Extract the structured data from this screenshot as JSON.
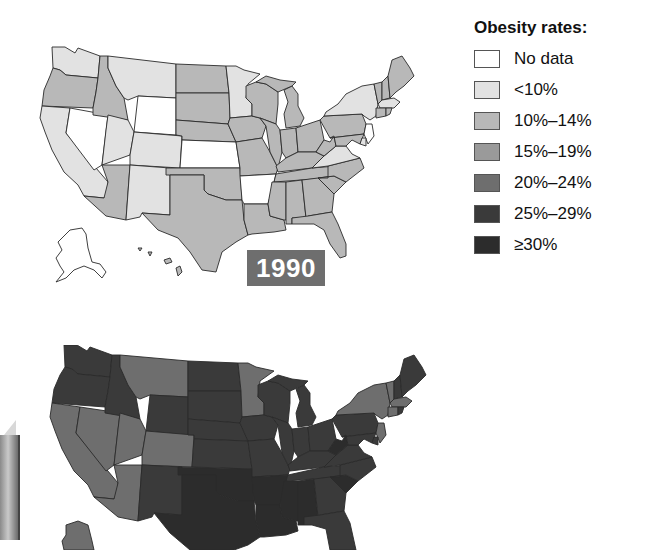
{
  "legend": {
    "title": "Obesity rates:",
    "items": [
      {
        "label": "No data",
        "color": "#ffffff"
      },
      {
        "label": "<10%",
        "color": "#e2e2e2"
      },
      {
        "label": "10%–14%",
        "color": "#b8b8b8"
      },
      {
        "label": "15%–19%",
        "color": "#9a9a9a"
      },
      {
        "label": "20%–24%",
        "color": "#6e6e6e"
      },
      {
        "label": "25%–29%",
        "color": "#3a3a3a"
      },
      {
        "label": "≥30%",
        "color": "#2c2c2c"
      }
    ]
  },
  "maps": [
    {
      "year_label": "1990",
      "year_badge_color": "#6e6e6e"
    },
    {
      "year_label": ""
    }
  ],
  "colors": {
    "nodata": "#ffffff",
    "lt10": "#e2e2e2",
    "r10_14": "#b8b8b8",
    "r15_19": "#9a9a9a",
    "r20_24": "#6e6e6e",
    "r25_29": "#3a3a3a",
    "ge30": "#2c2c2c"
  }
}
